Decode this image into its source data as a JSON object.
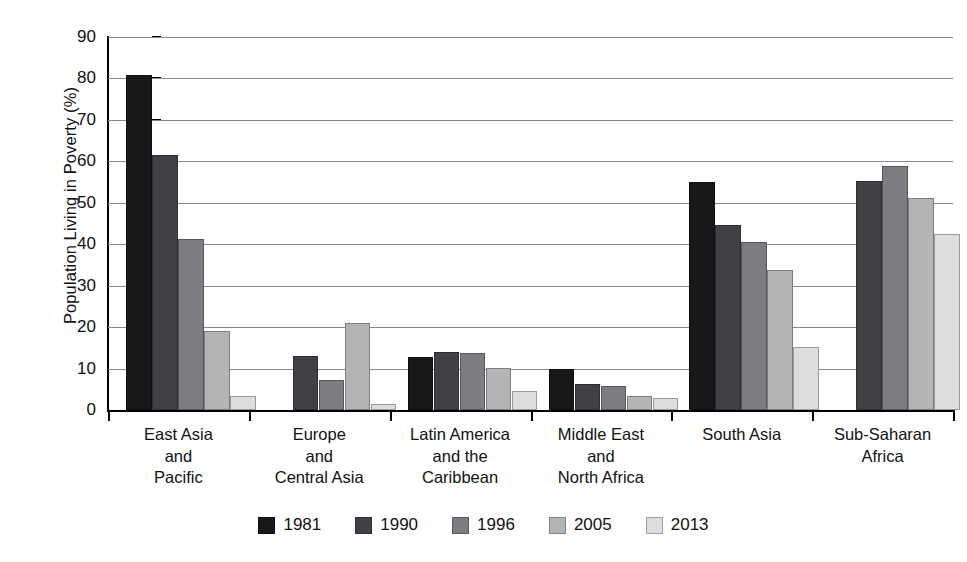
{
  "chart_data": {
    "type": "bar",
    "title": "",
    "xlabel": "",
    "ylabel": "Population Living in Poverty (%)",
    "ylim": [
      0,
      90
    ],
    "ytick_step": 10,
    "yticks": [
      "0",
      "10",
      "20",
      "30",
      "40",
      "50",
      "60",
      "70",
      "80",
      "90"
    ],
    "grid": true,
    "legend_position": "bottom",
    "categories": [
      "East Asia and Pacific",
      "Europe and Central Asia",
      "Latin America and the Caribbean",
      "Middle East and North Africa",
      "South Asia",
      "Sub-Saharan Africa"
    ],
    "category_label_lines": [
      [
        "East Asia",
        "and",
        "Pacific"
      ],
      [
        "Europe",
        "and",
        "Central Asia"
      ],
      [
        "Latin America",
        "and the",
        "Caribbean"
      ],
      [
        "Middle East",
        "and",
        "North Africa"
      ],
      [
        "South Asia"
      ],
      [
        "Sub-Saharan",
        "Africa"
      ]
    ],
    "series": [
      {
        "name": "1981",
        "color": "#17181a",
        "values": [
          80.8,
          null,
          12.8,
          9.8,
          54.9,
          null
        ]
      },
      {
        "name": "1990",
        "color": "#3f4145",
        "values": [
          61.5,
          13.1,
          14.1,
          6.3,
          44.6,
          55.2
        ]
      },
      {
        "name": "1996",
        "color": "#7b7d80",
        "values": [
          41.2,
          7.2,
          13.7,
          5.8,
          40.6,
          58.9
        ]
      },
      {
        "name": "2005",
        "color": "#b2b4b6",
        "values": [
          19.1,
          20.9,
          10.2,
          3.3,
          33.8,
          51.1
        ]
      },
      {
        "name": "2013",
        "color": "#dcdddf",
        "values": [
          3.5,
          1.5,
          4.6,
          2.9,
          15.1,
          42.4
        ]
      }
    ]
  },
  "legend": {
    "items": [
      {
        "label": "1981",
        "color": "#17181a"
      },
      {
        "label": "1990",
        "color": "#3f4145"
      },
      {
        "label": "1996",
        "color": "#7b7d80"
      },
      {
        "label": "2005",
        "color": "#b2b4b6"
      },
      {
        "label": "2013",
        "color": "#dcdddf"
      }
    ]
  },
  "axes": {
    "y_title": "Population Living in Poverty (%)"
  },
  "style": {
    "gridline_color": "#8a8a8a",
    "axis_color": "#000000",
    "background": "#ffffff",
    "text_color": "#111111"
  }
}
